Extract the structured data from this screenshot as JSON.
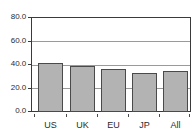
{
  "chart_data": {
    "type": "bar",
    "title": "",
    "subtitle": "",
    "xlabel": "",
    "ylabel": "",
    "categories": [
      "US",
      "UK",
      "EU",
      "JP",
      "All"
    ],
    "values": [
      41.0,
      39.0,
      36.0,
      32.5,
      34.5
    ],
    "series": [
      {
        "name": "",
        "values": [
          41.0,
          39.0,
          36.0,
          32.5,
          34.5
        ]
      }
    ],
    "ylim": [
      0.0,
      80.0
    ],
    "ytick_labels": [
      "0.0",
      "20.0",
      "40.0",
      "60.0",
      "80.0"
    ],
    "ytick_values": [
      0.0,
      20.0,
      40.0,
      60.0,
      80.0
    ],
    "grid": true,
    "grid_axis": "y",
    "legend": false,
    "legend_position": "none",
    "bar_fill_color": "#b3b3b3",
    "bar_edge_color": "#4a4a4a",
    "gridline_color": "#9a9a9a",
    "axis_color": "#3a3a3a",
    "background_color": "#ffffff"
  }
}
